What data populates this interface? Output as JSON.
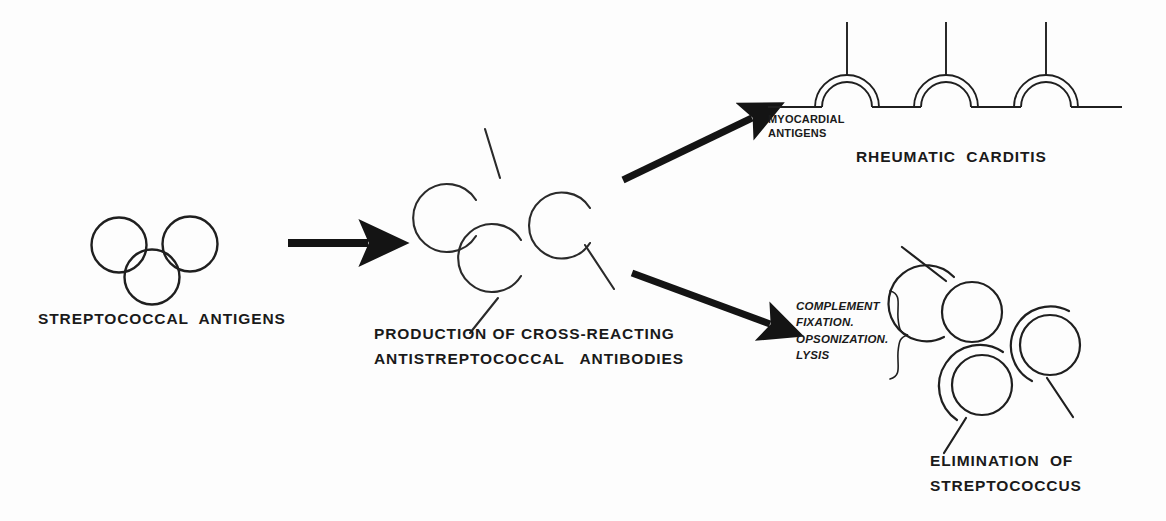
{
  "diagram": {
    "background_color": "#fdfdfd",
    "ink_color": "#1a1a1a"
  },
  "stage_left": {
    "caption": "STREPTOCOCCAL  ANTIGENS",
    "antigen_count": 3
  },
  "stage_middle": {
    "caption_line1": "PRODUCTION OF CROSS-REACTING",
    "caption_line2": "ANTISTREPTOCOCCAL   ANTIBODIES",
    "antibody_count": 3
  },
  "stage_top_right": {
    "tissue_label_line1": "MYOCARDIAL",
    "tissue_label_line2": "ANTIGENS",
    "outcome_caption": "RHEUMATIC  CARDITIS",
    "binding_site_count": 3
  },
  "stage_bottom_right": {
    "mechanism_line1": "COMPLEMENT",
    "mechanism_line2": "FIXATION.",
    "mechanism_line3": "OPSONIZATION.",
    "mechanism_line4": "LYSIS",
    "outcome_caption_line1": "ELIMINATION  OF",
    "outcome_caption_line2": "STREPTOCOCCUS",
    "opsonized_organism_count": 3
  },
  "arrows": [
    {
      "name": "left-to-middle",
      "direction": "right"
    },
    {
      "name": "middle-to-myocardium",
      "direction": "up-right"
    },
    {
      "name": "middle-to-elimination",
      "direction": "down-right"
    }
  ]
}
